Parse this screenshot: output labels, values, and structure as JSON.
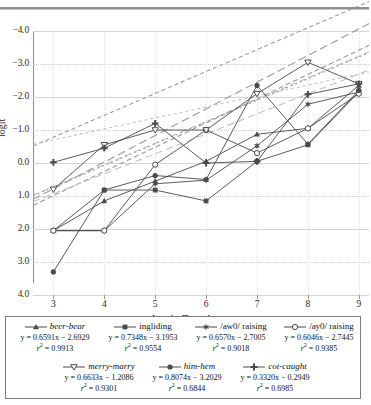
{
  "chart_data": {
    "type": "line",
    "title": "",
    "xlabel": "Age in Decades",
    "ylabel": "logit",
    "xlim": [
      2.6,
      9.2
    ],
    "ylim": [
      -4.0,
      4.0
    ],
    "xticks": [
      3,
      4,
      5,
      6,
      7,
      8,
      9
    ],
    "yticks": [
      -4.0,
      -3.0,
      -2.0,
      -1.0,
      0.0,
      1.0,
      2.0,
      3.0,
      4.0
    ],
    "grid": true,
    "legend_position": "below",
    "x": [
      3,
      4,
      5,
      6,
      7,
      8,
      9
    ],
    "series": [
      {
        "name": "beer-bear",
        "marker": "triangle",
        "italic": true,
        "equation": "y = 0.6591x − 2.6929",
        "r2": "0.9913",
        "slope": 0.6591,
        "intercept": -2.6929,
        "values": [
          -2.05,
          -1.15,
          -0.55,
          0.05,
          0.87,
          1.05,
          2.35
        ]
      },
      {
        "name": "ingliding",
        "marker": "square",
        "italic": false,
        "equation": "y = 0.7348x − 3.1953",
        "r2": "0.9554",
        "slope": 0.7348,
        "intercept": -3.1953,
        "values": [
          -2.05,
          -0.82,
          -0.82,
          -1.15,
          0.05,
          0.55,
          2.15
        ]
      },
      {
        "name": "/aw0/ raising",
        "marker": "star",
        "italic": false,
        "equation": "y = 0.6570x − 2.7005",
        "r2": "0.9018",
        "slope": 0.657,
        "intercept": -2.7005,
        "values": [
          -2.05,
          -2.05,
          -0.63,
          -0.52,
          0.52,
          1.78,
          2.15
        ]
      },
      {
        "name": "/ay0/ raising",
        "marker": "circle-open",
        "italic": false,
        "equation": "y = 0.6046x − 2.7445",
        "r2": "0.9385",
        "slope": 0.6046,
        "intercept": -2.7445,
        "values": [
          -2.05,
          -2.05,
          -0.05,
          1.0,
          0.3,
          1.05,
          2.1
        ]
      },
      {
        "name": "merry-marry",
        "marker": "triangle-down-open",
        "italic": true,
        "equation": "y = 0.6633x − 1.2086",
        "r2": "0.9301",
        "slope": 0.6633,
        "intercept": -1.2086,
        "values": [
          -0.8,
          0.55,
          1.0,
          1.0,
          2.1,
          3.05,
          2.4
        ]
      },
      {
        "name": "him-hem",
        "marker": "circle",
        "italic": true,
        "equation": "y = 0.8074x − 3.2029",
        "r2": "0.6844",
        "slope": 0.8074,
        "intercept": -3.2029,
        "values": [
          -3.3,
          -0.82,
          -0.38,
          -0.5,
          2.35,
          0.57,
          2.2
        ]
      },
      {
        "name": "cot-caught",
        "marker": "plus",
        "italic": true,
        "equation": "y = 0.3320x − 0.2949",
        "r2": "0.6985",
        "slope": 0.332,
        "intercept": -0.2949,
        "values": [
          0.02,
          0.45,
          1.2,
          0.0,
          0.05,
          2.08,
          2.4
        ]
      }
    ]
  },
  "axis": {
    "y_title": "logit",
    "x_title": "Age in Decades",
    "y_labels": [
      "4.0",
      "3.0",
      "2.0",
      "1.0",
      "0.0",
      "−1.0",
      "−2.0",
      "−3.0",
      "−4.0"
    ],
    "x_labels": [
      "3",
      "4",
      "5",
      "6",
      "7",
      "8",
      "9"
    ]
  },
  "legend": {
    "row1": [
      {
        "name": "beer-bear",
        "equation": "y = 0.6591x − 2.6929",
        "r2_value": "0.9913",
        "r2_label": "r",
        "r2_sup": "2",
        "eq_sep": " = "
      },
      {
        "name": "ingliding",
        "equation": "y = 0.7348x − 3.1953",
        "r2_value": "0.9554",
        "r2_label": "r",
        "r2_sup": "2",
        "eq_sep": " = "
      },
      {
        "name": "/aw0/ raising",
        "equation": "y = 0.6570x − 2.7005",
        "r2_value": "0.9018",
        "r2_label": "r",
        "r2_sup": "2",
        "eq_sep": " = "
      },
      {
        "name": "/ay0/ raising",
        "equation": "y = 0.6046x − 2.7445",
        "r2_value": "0.9385",
        "r2_label": "r",
        "r2_sup": "2",
        "eq_sep": " = "
      }
    ],
    "row2": [
      {
        "name": "merry-marry",
        "equation": "y = 0.6633x − 1.2086",
        "r2_value": "0.9301",
        "r2_label": "r",
        "r2_sup": "2",
        "eq_sep": " = "
      },
      {
        "name": "him-hem",
        "equation": "y = 0.8074x − 3.2029",
        "r2_value": "0.6844",
        "r2_label": "r",
        "r2_sup": "2",
        "eq_sep": " = "
      },
      {
        "name": "cot-caught",
        "equation": "y = 0.3320x − 0.2949",
        "r2_value": "0.6985",
        "r2_label": "r",
        "r2_sup": "2",
        "eq_sep": " = "
      }
    ]
  },
  "colors": {
    "line": "#4a4a4a",
    "trend": "#9a9a9a",
    "trend_light": "#c2c2c2",
    "grid": "#d6d6d6",
    "axis": "#8f8f8f",
    "text": "#1a1a1a"
  }
}
